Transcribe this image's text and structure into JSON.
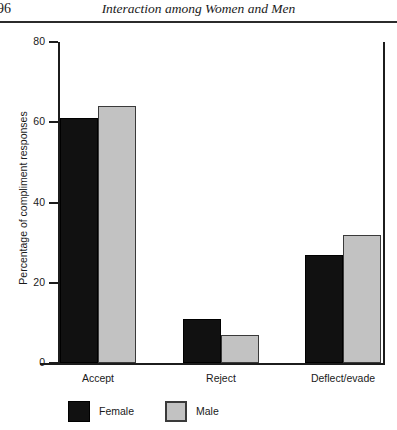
{
  "page": {
    "folio": "96",
    "running_title": "Interaction among Women and Men"
  },
  "chart_data": {
    "type": "bar",
    "title": "",
    "xlabel": "",
    "ylabel": "Percentage of compliment responses",
    "ylim": [
      0,
      80
    ],
    "yticks": [
      "0",
      "20",
      "40",
      "60",
      "80"
    ],
    "grid": false,
    "legend_position": "bottom",
    "categories": [
      "Accept",
      "Reject",
      "Deflect/evade"
    ],
    "series": [
      {
        "name": "Female",
        "color": "#111111",
        "values": [
          61,
          11,
          27
        ]
      },
      {
        "name": "Male",
        "color": "#c2c2c2",
        "values": [
          64,
          7,
          32
        ]
      }
    ]
  }
}
